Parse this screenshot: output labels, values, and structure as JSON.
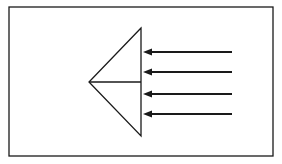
{
  "diagram": {
    "width": 282,
    "height": 164,
    "background": "#ffffff",
    "stroke_color": "#1a1a1a",
    "frame": {
      "x": 9,
      "y": 7,
      "width": 264,
      "height": 149
    },
    "prism": {
      "top": [
        141,
        28
      ],
      "left": [
        89,
        82
      ],
      "bottom": [
        141,
        136
      ],
      "midline_y": 82
    },
    "arrows": [
      {
        "y": 52,
        "x_start": 232,
        "x_tip": 143
      },
      {
        "y": 72,
        "x_start": 232,
        "x_tip": 143
      },
      {
        "y": 94,
        "x_start": 232,
        "x_tip": 143
      },
      {
        "y": 114,
        "x_start": 232,
        "x_tip": 143
      }
    ],
    "arrow_direction": "left"
  }
}
